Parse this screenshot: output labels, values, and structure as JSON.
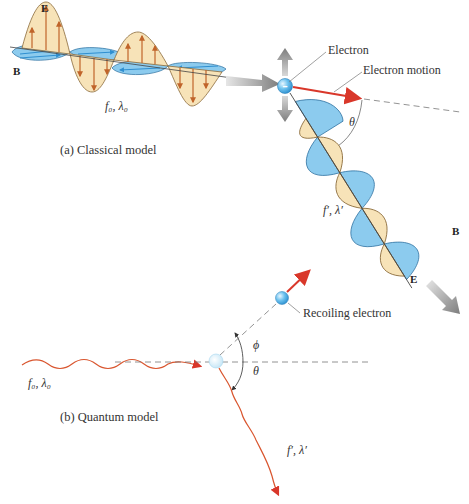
{
  "classical": {
    "caption": "(a) Classical model",
    "incident_E_label": "E",
    "incident_B_label": "B",
    "incident_wave_label": "f₀, λ₀",
    "electron_label": "Electron",
    "electron_motion_label": "Electron motion",
    "angle_label": "θ",
    "scattered_wave_label": "f′, λ′",
    "scattered_B_label": "B",
    "scattered_E_label": "E",
    "electron_symbol": "–"
  },
  "quantum": {
    "caption": "(b) Quantum model",
    "incident_wave_label": "f₀, λ₀",
    "recoil_label": "Recoiling electron",
    "phi_label": "ϕ",
    "theta_label": "θ",
    "scattered_wave_label": "f′, λ′"
  },
  "colors": {
    "e_field_fill": "#f7e3b8",
    "e_field_arrow": "#c0642a",
    "b_field_fill": "#8ccbee",
    "b_field_arrow": "#2f8fd0",
    "photon": "#d9552e",
    "electron_blue": "#5ab4e8",
    "gray_arrow": "#8a8a8a"
  }
}
